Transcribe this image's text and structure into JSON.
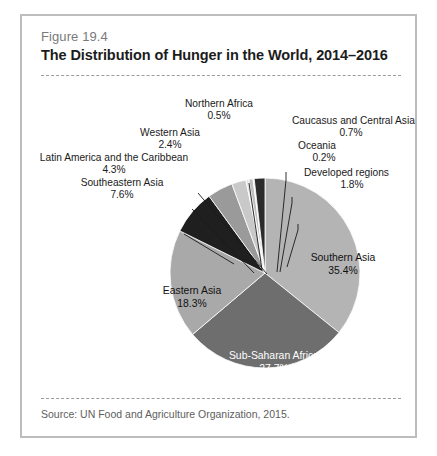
{
  "figure": {
    "number": "Figure 19.4",
    "title": "The Distribution of Hunger in the World, 2014–2016",
    "source": "Source: UN Food and Agriculture Organization, 2015."
  },
  "chart_data": {
    "type": "pie",
    "title": "The Distribution of Hunger in the World, 2014–2016",
    "subtitle": "Figure 19.4",
    "source": "Source: UN Food and Agriculture Organization, 2015.",
    "unit": "percent",
    "legend": "none",
    "labels_position": "inside-and-callout",
    "categories": [
      "Southern Asia",
      "Sub-Saharan Africa",
      "Eastern Asia",
      "Southeastern Asia",
      "Latin America and the Caribbean",
      "Western Asia",
      "Northern Africa",
      "Caucasus and Central Asia",
      "Oceania",
      "Developed regions"
    ],
    "values": [
      35.4,
      27.7,
      18.3,
      7.6,
      4.3,
      2.4,
      0.5,
      0.7,
      0.2,
      1.8
    ],
    "value_labels": [
      "35.4%",
      "27.7%",
      "18.3%",
      "7.6%",
      "4.3%",
      "2.4%",
      "0.5%",
      "0.7%",
      "0.2%",
      "1.8%"
    ],
    "colors": [
      "#b4b4b4",
      "#6e6e6e",
      "#a9a9a9",
      "#1f1f1f",
      "#9a9a9a",
      "#c9c9c9",
      "#e2e2e2",
      "#bfbfbf",
      "#efefef",
      "#2b2b2b"
    ],
    "slices": [
      {
        "name": "Southern Asia",
        "value": 35.4,
        "label": "Southern Asia",
        "pct": "35.4%",
        "color": "#b4b4b4",
        "placement": "inside",
        "text": "dark"
      },
      {
        "name": "Sub-Saharan Africa",
        "value": 27.7,
        "label": "Sub-Saharan Africa",
        "pct": "27.7%",
        "color": "#6e6e6e",
        "placement": "inside",
        "text": "light"
      },
      {
        "name": "Eastern Asia",
        "value": 18.3,
        "label": "Eastern Asia",
        "pct": "18.3%",
        "color": "#a9a9a9",
        "placement": "inside",
        "text": "dark"
      },
      {
        "name": "Southeastern Asia",
        "value": 7.6,
        "label": "Southeastern Asia",
        "pct": "7.6%",
        "color": "#1f1f1f",
        "placement": "callout",
        "text": "dark"
      },
      {
        "name": "Latin America and the Caribbean",
        "value": 4.3,
        "label": "Latin America and the Caribbean",
        "pct": "4.3%",
        "color": "#9a9a9a",
        "placement": "callout",
        "text": "dark"
      },
      {
        "name": "Western Asia",
        "value": 2.4,
        "label": "Western Asia",
        "pct": "2.4%",
        "color": "#c9c9c9",
        "placement": "callout",
        "text": "dark"
      },
      {
        "name": "Northern Africa",
        "value": 0.5,
        "label": "Northern Africa",
        "pct": "0.5%",
        "color": "#e2e2e2",
        "placement": "callout",
        "text": "dark"
      },
      {
        "name": "Caucasus and Central Asia",
        "value": 0.7,
        "label": "Caucasus and Central Asia",
        "pct": "0.7%",
        "color": "#bfbfbf",
        "placement": "callout",
        "text": "dark"
      },
      {
        "name": "Oceania",
        "value": 0.2,
        "label": "Oceania",
        "pct": "0.2%",
        "color": "#efefef",
        "placement": "callout",
        "text": "dark"
      },
      {
        "name": "Developed regions",
        "value": 1.8,
        "label": "Developed regions",
        "pct": "1.8%",
        "color": "#2b2b2b",
        "placement": "callout",
        "text": "dark"
      }
    ]
  }
}
